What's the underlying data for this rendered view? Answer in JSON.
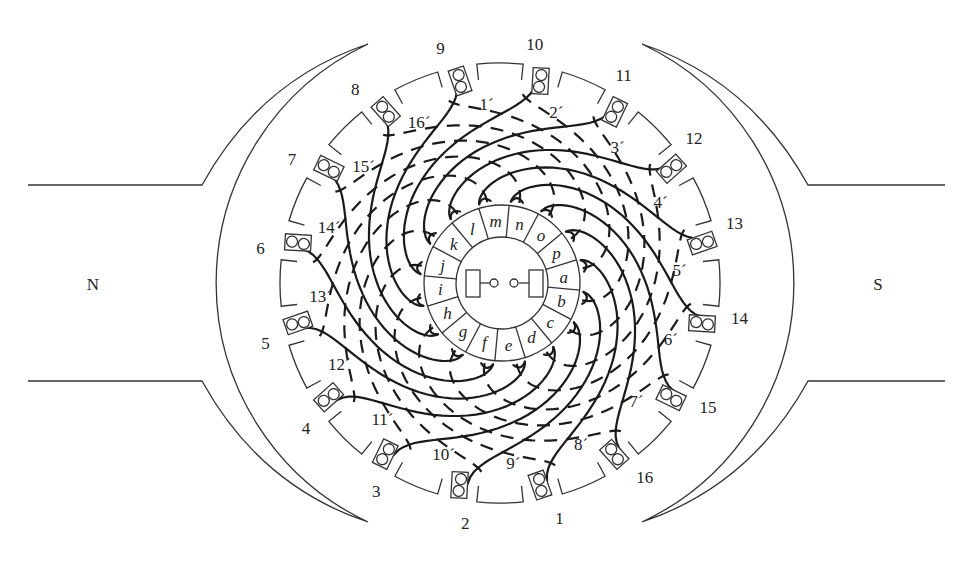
{
  "figure": {
    "poles": [
      {
        "label": "N",
        "side": "left",
        "label_x": 93,
        "label_y": 290
      },
      {
        "label": "S",
        "side": "right",
        "label_x": 878,
        "label_y": 290
      }
    ],
    "armature": {
      "center_x": 500,
      "center_y": 283,
      "radius": 220,
      "slot_radius": 208
    },
    "pole_face_radius": 264,
    "slots": [
      {
        "number": "1",
        "bottom_label": "1´"
      },
      {
        "number": "2",
        "bottom_label": "2´"
      },
      {
        "number": "3",
        "bottom_label": "3´"
      },
      {
        "number": "4",
        "bottom_label": "4´"
      },
      {
        "number": "5",
        "bottom_label": "5´"
      },
      {
        "number": "6",
        "bottom_label": "6´"
      },
      {
        "number": "7",
        "bottom_label": "7´"
      },
      {
        "number": "8",
        "bottom_label": "8´"
      },
      {
        "number": "9",
        "bottom_label": "9´"
      },
      {
        "number": "10",
        "bottom_label": "10´"
      },
      {
        "number": "11",
        "bottom_label": "11´"
      },
      {
        "number": "12",
        "bottom_label": "12´"
      },
      {
        "number": "13",
        "bottom_label": "13´"
      },
      {
        "number": "14",
        "bottom_label": "14´"
      },
      {
        "number": "15",
        "bottom_label": "15´"
      },
      {
        "number": "16",
        "bottom_label": "16´"
      }
    ],
    "commutator": {
      "outer_radius": 78,
      "inner_radius": 46,
      "segments": [
        "a",
        "b",
        "c",
        "d",
        "e",
        "f",
        "g",
        "h",
        "i",
        "j",
        "k",
        "l",
        "m",
        "n",
        "o",
        "p"
      ]
    },
    "brushes": [
      "left-brush",
      "right-brush"
    ]
  }
}
